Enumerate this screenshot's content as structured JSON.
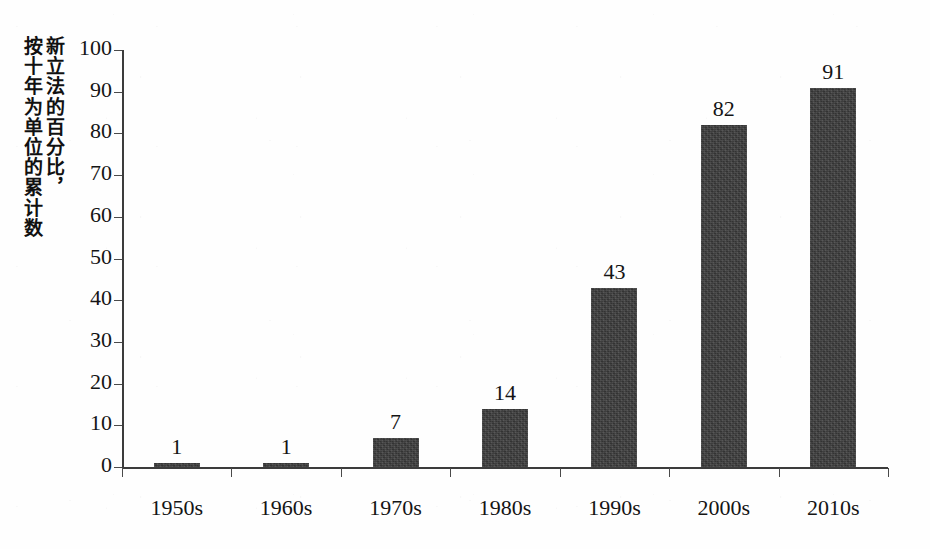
{
  "chart_data": {
    "type": "bar",
    "title": "",
    "xlabel": "",
    "ylabel": "新立法的百分比，\n按十年为单位的累计数",
    "categories": [
      "1950s",
      "1960s",
      "1970s",
      "1980s",
      "1990s",
      "2000s",
      "2010s"
    ],
    "values": [
      1,
      1,
      7,
      14,
      43,
      82,
      91
    ],
    "value_labels": [
      "1",
      "1",
      "7",
      "14",
      "43",
      "82",
      "91"
    ],
    "ylim": [
      0,
      100
    ],
    "ytick_step": 10,
    "yticks": [
      "0",
      "10",
      "20",
      "30",
      "40",
      "50",
      "60",
      "70",
      "80",
      "90",
      "100"
    ],
    "grid": false,
    "legend": "none",
    "bar_color": "#3b3b3b",
    "axis_color": "#3c3c3c",
    "background_color": "#ffffff"
  }
}
